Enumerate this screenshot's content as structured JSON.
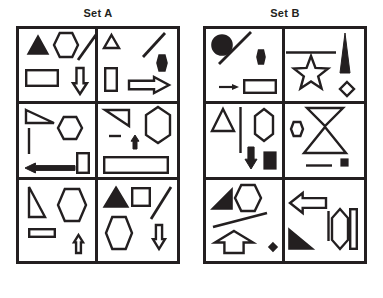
{
  "page": {
    "background_color": "#ffffff",
    "ink_color": "#231f20"
  },
  "sets": [
    {
      "id": "set-a",
      "label": "Set A",
      "frame": {
        "x": 16,
        "y": 26,
        "width": 164,
        "height": 238
      },
      "columns": 2,
      "rows": 3,
      "cells": [
        {
          "id": "a1",
          "position": "row1-col1",
          "shapes": [
            {
              "name": "filled-triangle-up",
              "type": "triangle",
              "fill": "solid",
              "x": 8,
              "y": 6,
              "w": 22,
              "h": 20,
              "rot": 0
            },
            {
              "name": "hexagon-outline",
              "type": "hexagon",
              "fill": "none",
              "x": 34,
              "y": 3,
              "w": 26,
              "h": 26,
              "rot": 0
            },
            {
              "name": "diagonal-line",
              "type": "line",
              "fill": "none",
              "x": 58,
              "y": 2,
              "w": 22,
              "h": 30,
              "rot": 0
            },
            {
              "name": "rectangle-outline",
              "type": "rect",
              "fill": "none",
              "x": 6,
              "y": 40,
              "w": 34,
              "h": 18,
              "rot": 0
            },
            {
              "name": "down-arrow-outline",
              "type": "arrow-down",
              "fill": "none",
              "x": 53,
              "y": 38,
              "w": 16,
              "h": 28,
              "rot": 0
            }
          ]
        },
        {
          "id": "a2",
          "position": "row1-col2",
          "shapes": [
            {
              "name": "small-triangle-outline",
              "type": "triangle",
              "fill": "none",
              "x": 5,
              "y": 5,
              "w": 17,
              "h": 15,
              "rot": 0
            },
            {
              "name": "diagonal-line",
              "type": "line",
              "fill": "none",
              "x": 44,
              "y": 3,
              "w": 24,
              "h": 26,
              "rot": 0
            },
            {
              "name": "small-filled-hexagon",
              "type": "hexagon",
              "fill": "solid",
              "x": 58,
              "y": 25,
              "w": 12,
              "h": 18,
              "rot": 0
            },
            {
              "name": "vertical-rectangle-outline",
              "type": "rect",
              "fill": "none",
              "x": 6,
              "y": 38,
              "w": 14,
              "h": 25,
              "rot": 0
            },
            {
              "name": "right-arrow-outline",
              "type": "arrow-right",
              "fill": "none",
              "x": 30,
              "y": 47,
              "w": 42,
              "h": 18,
              "rot": 0
            }
          ]
        },
        {
          "id": "a3",
          "position": "row2-col1",
          "shapes": [
            {
              "name": "right-triangle-outline",
              "type": "right-triangle",
              "fill": "none",
              "x": 6,
              "y": 5,
              "w": 30,
              "h": 15,
              "rot": 0
            },
            {
              "name": "hexagon-outline",
              "type": "hexagon",
              "fill": "none",
              "x": 38,
              "y": 12,
              "w": 26,
              "h": 24,
              "rot": 0
            },
            {
              "name": "vertical-line",
              "type": "vline",
              "fill": "none",
              "x": 9,
              "y": 23,
              "w": 2,
              "h": 28,
              "rot": 0
            },
            {
              "name": "left-arrow-filled",
              "type": "arrow-left-solid",
              "fill": "solid",
              "x": 5,
              "y": 58,
              "w": 52,
              "h": 12,
              "rot": 0
            },
            {
              "name": "small-rectangle-outline",
              "type": "rect",
              "fill": "none",
              "x": 57,
              "y": 48,
              "w": 14,
              "h": 22,
              "rot": 0
            }
          ]
        },
        {
          "id": "a4",
          "position": "row2-col2",
          "shapes": [
            {
              "name": "right-triangle-outline",
              "type": "right-triangle-dn",
              "fill": "none",
              "x": 6,
              "y": 5,
              "w": 26,
              "h": 18,
              "rot": 0
            },
            {
              "name": "elongated-hexagon-outline",
              "type": "long-hexagon",
              "fill": "none",
              "x": 47,
              "y": 2,
              "w": 26,
              "h": 38,
              "rot": 0
            },
            {
              "name": "short-horizontal-line",
              "type": "hline",
              "fill": "none",
              "x": 10,
              "y": 31,
              "w": 14,
              "h": 2,
              "rot": 0
            },
            {
              "name": "small-up-arrow-filled",
              "type": "arrow-up-solid",
              "fill": "solid",
              "x": 32,
              "y": 30,
              "w": 10,
              "h": 16,
              "rot": 0
            },
            {
              "name": "wide-rectangle-outline",
              "type": "rect",
              "fill": "none",
              "x": 5,
              "y": 52,
              "w": 66,
              "h": 18,
              "rot": 0
            }
          ]
        },
        {
          "id": "a5",
          "position": "row3-col1",
          "shapes": [
            {
              "name": "thin-right-triangle-outline",
              "type": "right-triangle-tall",
              "fill": "none",
              "x": 9,
              "y": 6,
              "w": 18,
              "h": 32,
              "rot": 0
            },
            {
              "name": "hexagon-outline",
              "type": "hexagon",
              "fill": "none",
              "x": 38,
              "y": 8,
              "w": 30,
              "h": 34,
              "rot": 0
            },
            {
              "name": "small-rectangle-outline",
              "type": "rect",
              "fill": "none",
              "x": 9,
              "y": 48,
              "w": 28,
              "h": 10,
              "rot": 0
            },
            {
              "name": "small-up-arrow-outline",
              "type": "arrow-up",
              "fill": "none",
              "x": 54,
              "y": 54,
              "w": 11,
              "h": 20,
              "rot": 0
            }
          ]
        },
        {
          "id": "a6",
          "position": "row3-col2",
          "shapes": [
            {
              "name": "filled-triangle-up",
              "type": "triangle",
              "fill": "solid",
              "x": 5,
              "y": 6,
              "w": 26,
              "h": 22,
              "rot": 0
            },
            {
              "name": "square-outline",
              "type": "rect",
              "fill": "none",
              "x": 33,
              "y": 7,
              "w": 20,
              "h": 20,
              "rot": 0
            },
            {
              "name": "diagonal-line",
              "type": "line",
              "fill": "none",
              "x": 52,
              "y": 6,
              "w": 22,
              "h": 34,
              "rot": 0
            },
            {
              "name": "hexagon-outline",
              "type": "hexagon",
              "fill": "none",
              "x": 7,
              "y": 36,
              "w": 28,
              "h": 34,
              "rot": 0
            },
            {
              "name": "down-arrow-outline",
              "type": "arrow-down",
              "fill": "none",
              "x": 54,
              "y": 44,
              "w": 14,
              "h": 26,
              "rot": 0
            }
          ]
        }
      ]
    },
    {
      "id": "set-b",
      "label": "Set B",
      "frame": {
        "x": 203,
        "y": 26,
        "width": 164,
        "height": 238
      },
      "columns": 2,
      "rows": 3,
      "cells": [
        {
          "id": "b1",
          "position": "row1-col1",
          "shapes": [
            {
              "name": "filled-circle",
              "type": "circle",
              "fill": "solid",
              "x": 5,
              "y": 5,
              "w": 22,
              "h": 22,
              "rot": 0
            },
            {
              "name": "diagonal-line",
              "type": "line",
              "fill": "none",
              "x": 12,
              "y": 2,
              "w": 34,
              "h": 34,
              "rot": 0
            },
            {
              "name": "small-filled-hexagon",
              "type": "hexagon",
              "fill": "solid",
              "x": 50,
              "y": 20,
              "w": 10,
              "h": 16,
              "rot": 0
            },
            {
              "name": "small-right-arrow",
              "type": "arrow-right-thin",
              "fill": "solid",
              "x": 12,
              "y": 54,
              "w": 22,
              "h": 8,
              "rot": 0
            },
            {
              "name": "rectangle-outline",
              "type": "rect",
              "fill": "none",
              "x": 37,
              "y": 50,
              "w": 34,
              "h": 15,
              "rot": 0
            }
          ]
        },
        {
          "id": "b2",
          "position": "row1-col2",
          "shapes": [
            {
              "name": "horizontal-line",
              "type": "hline",
              "fill": "none",
              "x": 0,
              "y": 22,
              "w": 52,
              "h": 3,
              "rot": 0
            },
            {
              "name": "star-outline",
              "type": "star",
              "fill": "none",
              "x": 6,
              "y": 26,
              "w": 40,
              "h": 38,
              "rot": 0
            },
            {
              "name": "tall-filled-spike-triangle",
              "type": "spike",
              "fill": "solid",
              "x": 54,
              "y": 3,
              "w": 12,
              "h": 42,
              "rot": 0
            },
            {
              "name": "small-diamond-outline",
              "type": "diamond",
              "fill": "none",
              "x": 54,
              "y": 52,
              "w": 16,
              "h": 16,
              "rot": 0
            }
          ]
        },
        {
          "id": "b3",
          "position": "row2-col1",
          "shapes": [
            {
              "name": "triangle-outline",
              "type": "triangle",
              "fill": "none",
              "x": 5,
              "y": 4,
              "w": 24,
              "h": 24,
              "rot": 0
            },
            {
              "name": "vertical-line",
              "type": "vline",
              "fill": "none",
              "x": 33,
              "y": 2,
              "w": 3,
              "h": 48,
              "rot": 0
            },
            {
              "name": "elongated-hexagon-outline",
              "type": "long-hexagon",
              "fill": "none",
              "x": 48,
              "y": 4,
              "w": 20,
              "h": 34,
              "rot": 0
            },
            {
              "name": "filled-down-arrow",
              "type": "arrow-down-solid",
              "fill": "solid",
              "x": 38,
              "y": 42,
              "w": 14,
              "h": 24,
              "rot": 0
            },
            {
              "name": "filled-square",
              "type": "rect",
              "fill": "solid",
              "x": 57,
              "y": 47,
              "w": 14,
              "h": 19,
              "rot": 0
            }
          ]
        },
        {
          "id": "b4",
          "position": "row2-col2",
          "shapes": [
            {
              "name": "small-hexagon-outline",
              "type": "hexagon",
              "fill": "none",
              "x": 5,
              "y": 17,
              "w": 14,
              "h": 16,
              "rot": 0
            },
            {
              "name": "inverted-triangle-outline",
              "type": "triangle-down",
              "fill": "none",
              "x": 21,
              "y": 3,
              "w": 38,
              "h": 20,
              "rot": 0
            },
            {
              "name": "triangle-outline",
              "type": "triangle",
              "fill": "none",
              "x": 18,
              "y": 22,
              "w": 44,
              "h": 28,
              "rot": 0
            },
            {
              "name": "horizontal-line",
              "type": "hline",
              "fill": "none",
              "x": 20,
              "y": 60,
              "w": 28,
              "h": 3,
              "rot": 0
            },
            {
              "name": "small-filled-square",
              "type": "rect",
              "fill": "solid",
              "x": 55,
              "y": 54,
              "w": 9,
              "h": 9,
              "rot": 0
            }
          ]
        },
        {
          "id": "b5",
          "position": "row3-col1",
          "shapes": [
            {
              "name": "filled-right-triangle",
              "type": "right-triangle-solid",
              "fill": "solid",
              "x": 5,
              "y": 8,
              "w": 22,
              "h": 22,
              "rot": 0
            },
            {
              "name": "hexagon-outline",
              "type": "hexagon",
              "fill": "none",
              "x": 28,
              "y": 4,
              "w": 28,
              "h": 28,
              "rot": 0
            },
            {
              "name": "diagonal-line",
              "type": "line",
              "fill": "none",
              "x": 6,
              "y": 32,
              "w": 56,
              "h": 16,
              "rot": 0
            },
            {
              "name": "up-arrow-house-outline",
              "type": "arrow-up-wide",
              "fill": "none",
              "x": 8,
              "y": 50,
              "w": 40,
              "h": 24,
              "rot": 0
            },
            {
              "name": "small-filled-diamond",
              "type": "diamond",
              "fill": "solid",
              "x": 62,
              "y": 62,
              "w": 10,
              "h": 10,
              "rot": 0
            }
          ]
        },
        {
          "id": "b6",
          "position": "row3-col2",
          "shapes": [
            {
              "name": "left-arrow-outline",
              "type": "arrow-left",
              "fill": "none",
              "x": 4,
              "y": 12,
              "w": 38,
              "h": 22,
              "rot": 0
            },
            {
              "name": "vertical-line",
              "type": "vline",
              "fill": "none",
              "x": 42,
              "y": 30,
              "w": 3,
              "h": 32,
              "rot": 0
            },
            {
              "name": "elongated-hexagon-outline",
              "type": "long-hexagon",
              "fill": "none",
              "x": 46,
              "y": 28,
              "w": 18,
              "h": 42,
              "rot": 0
            },
            {
              "name": "vertical-rectangle-outline",
              "type": "rect",
              "fill": "none",
              "x": 64,
              "y": 28,
              "w": 9,
              "h": 42,
              "rot": 0
            },
            {
              "name": "filled-right-triangle",
              "type": "right-triangle-solid-br",
              "fill": "solid",
              "x": 3,
              "y": 48,
              "w": 26,
              "h": 22,
              "rot": 0
            }
          ]
        }
      ]
    }
  ]
}
